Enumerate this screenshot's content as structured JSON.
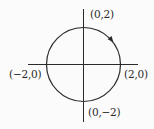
{
  "diagram": {
    "type": "circle-on-axes",
    "circle": {
      "center": [
        0,
        0
      ],
      "radius": 2,
      "orientation": "clockwise"
    },
    "labels": {
      "top": "(0,2)",
      "left": "(−2,0)",
      "right": "(2,0)",
      "bottom": "(0,−2)"
    },
    "colors": {
      "stroke": "#2a2a2a",
      "background": "#fbfbfb"
    }
  }
}
